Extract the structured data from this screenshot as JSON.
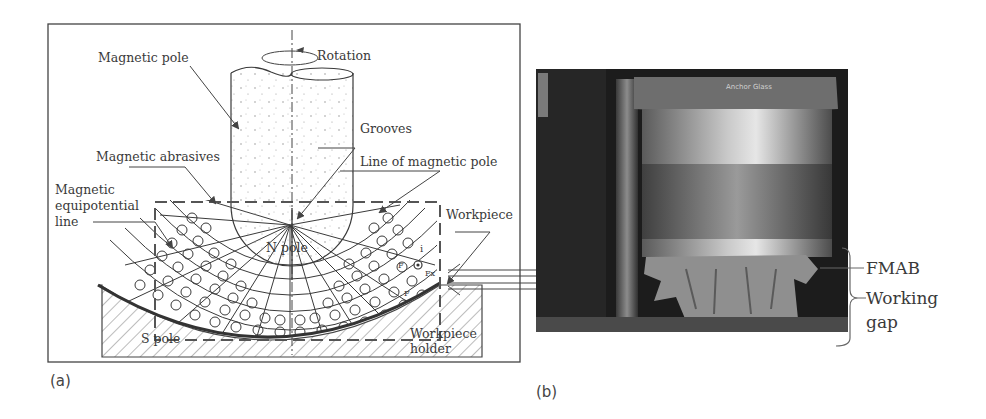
{
  "figure": {
    "panel_a": {
      "letter": "(a)",
      "labels": {
        "magnetic_pole": "Magnetic pole",
        "rotation": "Rotation",
        "grooves": "Grooves",
        "magnetic_abrasives": "Magnetic abrasives",
        "line_of_magnetic_pole": "Line of magnetic pole",
        "equipotential_1": "Magnetic",
        "equipotential_2": "equipotential",
        "equipotential_3": "line",
        "workpiece": "Workpiece",
        "n_pole": "N pole",
        "s_pole": "S pole",
        "workpiece_holder_1": "Workpiece",
        "workpiece_holder_2": "holder",
        "force_i": "i",
        "force_fx": "Fx",
        "force_f": "F",
        "force_fy": "F"
      }
    },
    "panel_b": {
      "letter": "(b)",
      "photo_text": "Anchor Glass",
      "labels": {
        "fmab": "FMAB",
        "working_gap_1": "Working",
        "working_gap_2": "gap"
      }
    },
    "colors": {
      "line": "#3a3a3a",
      "dash": "#555555",
      "photo_dark": "#1c1c1c",
      "cylinder_light": "#bdbdbd"
    }
  }
}
